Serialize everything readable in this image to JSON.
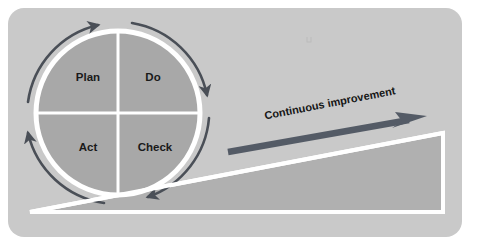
{
  "diagram": {
    "type": "pdca-continuous-improvement",
    "background_color": "#ffffff",
    "panel": {
      "name": "figure-panel",
      "fill": "#c9c9c9",
      "x": 8,
      "y": 8,
      "width": 454,
      "height": 229,
      "corner_radius": 16
    },
    "cycle": {
      "name": "pdca-wheel",
      "center_x": 118,
      "center_y": 113,
      "radius": 85,
      "ring_color": "#ffffff",
      "ring_width": 5,
      "fill": "#a8a8a8",
      "divider_color": "#ffffff",
      "divider_width": 3,
      "rotation_direction": "clockwise",
      "quadrants": [
        {
          "id": "plan",
          "label": "Plan",
          "position": "top-left",
          "cx": 88,
          "cy": 78
        },
        {
          "id": "do",
          "label": "Do",
          "position": "top-right",
          "cx": 153,
          "cy": 78
        },
        {
          "id": "act",
          "label": "Act",
          "position": "bottom-left",
          "cx": 88,
          "cy": 148
        },
        {
          "id": "check",
          "label": "Check",
          "position": "bottom-right",
          "cx": 155,
          "cy": 148
        }
      ],
      "rotation_arrows": {
        "color": "#4a4f57",
        "stroke_width": 2.6,
        "count": 4
      }
    },
    "improvement_arrow": {
      "name": "continuous-improvement-arrow",
      "label": "Continuous improvement",
      "color": "#545b66",
      "thickness": 6,
      "start_x": 228,
      "start_y": 152,
      "end_x": 424,
      "end_y": 117,
      "label_angle_degrees": -11,
      "label_x": 330,
      "label_y": 104
    },
    "ramp": {
      "name": "improvement-ramp",
      "fill": "#b0b0b0",
      "outline_color": "#ffffff",
      "outline_width": 4,
      "points": "30,212 443,133 443,212"
    }
  }
}
